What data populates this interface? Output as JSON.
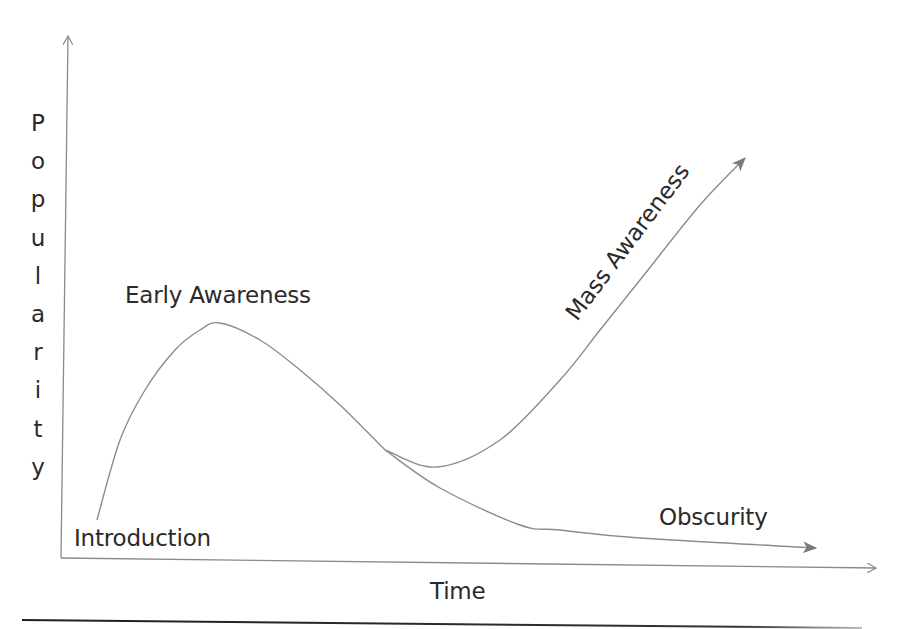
{
  "chart_data": {
    "type": "line",
    "title": "",
    "xlabel": "Time",
    "ylabel": "Popularity",
    "grid": false,
    "legend": null,
    "annotations": [
      "Introduction",
      "Early Awareness",
      "Mass Awareness",
      "Obscurity"
    ],
    "series": [
      {
        "name": "Early Awareness phase",
        "points": [
          [
            97,
            520
          ],
          [
            120,
            440
          ],
          [
            145,
            390
          ],
          [
            175,
            350
          ],
          [
            200,
            330
          ],
          [
            220,
            323
          ],
          [
            260,
            340
          ],
          [
            300,
            370
          ],
          [
            340,
            405
          ],
          [
            385,
            450
          ]
        ]
      },
      {
        "name": "Mass Awareness",
        "points": [
          [
            385,
            450
          ],
          [
            437,
            467
          ],
          [
            500,
            440
          ],
          [
            560,
            380
          ],
          [
            600,
            330
          ],
          [
            640,
            280
          ],
          [
            700,
            205
          ],
          [
            745,
            158
          ]
        ],
        "arrow": true
      },
      {
        "name": "Obscurity",
        "points": [
          [
            385,
            450
          ],
          [
            440,
            488
          ],
          [
            520,
            525
          ],
          [
            560,
            530
          ],
          [
            640,
            538
          ],
          [
            816,
            548
          ]
        ],
        "arrow": true
      }
    ]
  },
  "labels": {
    "y_axis_letters": [
      "P",
      "o",
      "p",
      "u",
      "l",
      "a",
      "r",
      "i",
      "t",
      "y"
    ],
    "x_axis": "Time",
    "introduction": "Introduction",
    "early_awareness": "Early Awareness",
    "mass_awareness": "Mass Awareness",
    "obscurity": "Obscurity"
  },
  "colors": {
    "axis": "#8a8a8a",
    "curve": "#8c8c8c",
    "arrowhead": "#7a7a7a",
    "text": "#2a2a2a",
    "rule": "#1e1e1e"
  }
}
